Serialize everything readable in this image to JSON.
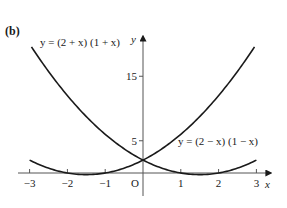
{
  "figure": {
    "part_label": "(b)",
    "origin_label": "O",
    "x_axis_var": "x",
    "y_axis_var": "y",
    "colors": {
      "ink": "#1a1a1a",
      "background": "#ffffff"
    }
  },
  "chart_data": {
    "type": "line",
    "title": "(b)",
    "xlabel": "x",
    "ylabel": "y",
    "xlim": [
      -3,
      3
    ],
    "ylim": [
      0,
      20
    ],
    "grid": false,
    "legend": "inline curve labels",
    "x_ticks": [
      -3,
      -2,
      -1,
      1,
      2,
      3
    ],
    "x_tick_labels": [
      "−3",
      "−2",
      "−1",
      "1",
      "2",
      "3"
    ],
    "y_ticks": [
      5,
      15
    ],
    "y_tick_labels": [
      "5",
      "15"
    ],
    "series": [
      {
        "name": "y = (2 + x) (1 + x)",
        "label_text": "y = (2 + x) (1 + x)",
        "x": [
          -3,
          -2.5,
          -2,
          -1.5,
          -1,
          -0.5,
          0,
          0.5,
          1,
          1.5,
          2,
          2.5,
          3
        ],
        "values": [
          2,
          0.75,
          0,
          -0.25,
          0,
          0.75,
          2,
          3.75,
          6,
          8.75,
          12,
          15.75,
          20
        ]
      },
      {
        "name": "y = (2 − x) (1 − x)",
        "label_text": "y = (2 − x) (1 − x)",
        "x": [
          -3,
          -2.5,
          -2,
          -1.5,
          -1,
          -0.5,
          0,
          0.5,
          1,
          1.5,
          2,
          2.5,
          3
        ],
        "values": [
          20,
          15.75,
          12,
          8.75,
          6,
          3.75,
          2,
          0.75,
          0,
          -0.25,
          0,
          0.75,
          2
        ]
      }
    ],
    "annotations": [
      "O"
    ]
  }
}
